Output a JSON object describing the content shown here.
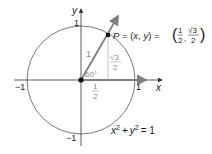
{
  "diagram": {
    "axes": {
      "x_label": "x",
      "y_label": "y",
      "x_ticks": [
        "−1",
        "1"
      ],
      "y_ticks": [
        "1",
        "−1"
      ]
    },
    "point": {
      "name": "P",
      "label_prefix": "P = (x, y) =",
      "x_num": "1",
      "x_den": "2",
      "y_num": "√3",
      "y_den": "2"
    },
    "radius_label": "1",
    "angle_label": "60°",
    "horizontal_leg": {
      "num": "1",
      "den": "2"
    },
    "vertical_leg": {
      "num": "√3",
      "den": "2"
    },
    "equation": {
      "lhs_x": "x",
      "exp1": "2",
      "plus": "+",
      "lhs_y": "y",
      "exp2": "2",
      "rhs": "= 1"
    },
    "colors": {
      "ray": "#7f7f7f",
      "circle": "#555555",
      "axes": "#333333",
      "gray_text": "#8a8a8a"
    }
  }
}
